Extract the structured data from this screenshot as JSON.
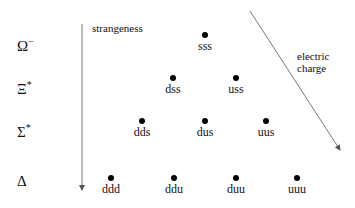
{
  "axes": {
    "strangeness_label": "strangeness",
    "charge_label_line1": "electric",
    "charge_label_line2": "charge"
  },
  "rows": [
    {
      "symbol": "Ω",
      "superscript": "−",
      "y": 45
    },
    {
      "symbol": "Ξ",
      "superscript": "*",
      "y": 88
    },
    {
      "symbol": "Σ",
      "superscript": "*",
      "y": 131
    },
    {
      "symbol": "Δ",
      "superscript": "",
      "y": 178
    }
  ],
  "particles": [
    {
      "label": "sss",
      "x": 205,
      "y": 35
    },
    {
      "label": "dss",
      "x": 173,
      "y": 78
    },
    {
      "label": "uss",
      "x": 236,
      "y": 78
    },
    {
      "label": "dds",
      "x": 142,
      "y": 121
    },
    {
      "label": "dus",
      "x": 205,
      "y": 121
    },
    {
      "label": "uus",
      "x": 266,
      "y": 121
    },
    {
      "label": "ddd",
      "x": 111,
      "y": 178
    },
    {
      "label": "ddu",
      "x": 174,
      "y": 178
    },
    {
      "label": "duu",
      "x": 236,
      "y": 178
    },
    {
      "label": "uuu",
      "x": 297,
      "y": 178
    }
  ]
}
